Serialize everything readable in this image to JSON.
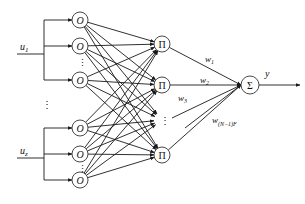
{
  "diagram": {
    "type": "neural-network",
    "colors": {
      "stroke": "#1a1a1a",
      "background": "#ffffff"
    },
    "inputs": [
      {
        "id": "u1",
        "label": "u",
        "sub": "1",
        "y": 54,
        "bus_top": 20,
        "bus_bottom": 80
      },
      {
        "id": "uz",
        "label": "u",
        "sub": "z",
        "y": 158,
        "bus_top": 128,
        "bus_bottom": 180
      }
    ],
    "input_ellipsis": "⋮",
    "o_nodes": [
      {
        "label": "O",
        "y": 20,
        "group": 0
      },
      {
        "label": "O",
        "y": 46,
        "group": 0
      },
      {
        "label": "O",
        "y": 80,
        "group": 0
      },
      {
        "label": "O",
        "y": 128,
        "group": 1
      },
      {
        "label": "O",
        "y": 154,
        "group": 1
      },
      {
        "label": "O",
        "y": 180,
        "group": 1
      }
    ],
    "o_ellipsis": "⋮",
    "pi_nodes": [
      {
        "label": "Π",
        "y": 44
      },
      {
        "label": "Π",
        "y": 85
      },
      {
        "label": "Π",
        "y": 155
      }
    ],
    "pi_ellipsis": "⋮",
    "sum_node": {
      "label": "Σ",
      "x": 250,
      "y": 85
    },
    "weights": [
      {
        "label": "w",
        "sub": "1"
      },
      {
        "label": "w",
        "sub": "2"
      },
      {
        "label": "w",
        "sub": "3"
      },
      {
        "label": "w",
        "sub": "(N−1)F"
      }
    ],
    "output": {
      "label": "y"
    }
  }
}
